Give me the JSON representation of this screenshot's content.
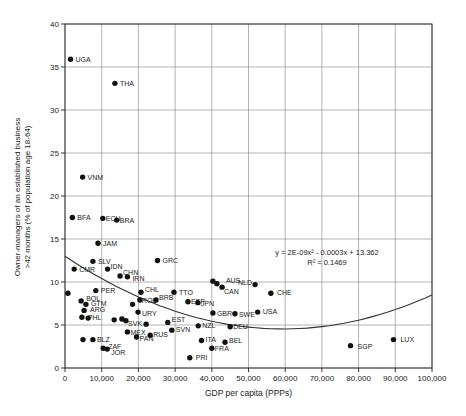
{
  "figure": {
    "x_axis_title": "GDP per capita (PPPs)",
    "y_axis_title_line1": "Owner-managers of an established business",
    "y_axis_title_line2": ">42 months (% of population age 18-64)",
    "equation_line1": "y = 2E-09x² - 0.0003x + 13.362",
    "equation_line2": "R² = 0.1469",
    "dot_color": "#111111",
    "grid_color": "#808080",
    "border_color": "#333333",
    "label_color": "#222222"
  },
  "chart_data": {
    "type": "scatter",
    "title": "",
    "xlabel": "GDP per capita (PPPs)",
    "ylabel": "Owner-managers of an established business >42 months (% of population age 18-64)",
    "xlim": [
      0,
      100000
    ],
    "ylim": [
      0,
      40
    ],
    "grid": true,
    "x_tick_values": [
      0,
      10000,
      20000,
      30000,
      40000,
      50000,
      60000,
      70000,
      80000,
      90000,
      100000
    ],
    "x_tick_labels": [
      "0",
      "10,000",
      "20,000",
      "30,000",
      "40,000",
      "50,000",
      "60,000",
      "70,000",
      "80,000",
      "90,000",
      "100,000"
    ],
    "y_tick_values": [
      0,
      5,
      10,
      15,
      20,
      25,
      30,
      35,
      40
    ],
    "y_tick_labels": [
      "0",
      "5",
      "10",
      "15",
      "20",
      "25",
      "30",
      "35",
      "40"
    ],
    "annotation": {
      "equation": "y = 2E-09x² - 0.0003x + 13.362",
      "r_squared": "R² = 0.1469"
    },
    "trendline": {
      "type": "quadratic",
      "a": 2.4e-09,
      "b": -0.000285,
      "c": 13.0
    },
    "points": [
      {
        "label": "UGA",
        "x": 1500,
        "y": 35.9
      },
      {
        "label": "THA",
        "x": 13600,
        "y": 33.1
      },
      {
        "label": "VNM",
        "x": 4800,
        "y": 22.2
      },
      {
        "label": "BFA",
        "x": 2000,
        "y": 17.5
      },
      {
        "label": "ECU",
        "x": 10300,
        "y": 17.4,
        "dx": 3
      },
      {
        "label": "BRA",
        "x": 14100,
        "y": 17.2,
        "dx": 3
      },
      {
        "label": "JAM",
        "x": 9000,
        "y": 14.5
      },
      {
        "label": "SLV",
        "x": 7600,
        "y": 12.4
      },
      {
        "label": "GRC",
        "x": 25200,
        "y": 12.5
      },
      {
        "label": "CMR",
        "x": 2500,
        "y": 11.5
      },
      {
        "label": "IDN",
        "x": 11600,
        "y": 11.5,
        "dx": 3,
        "dy": 0
      },
      {
        "label": "CHN",
        "x": 15000,
        "y": 10.7,
        "dx": 3,
        "dy": -1
      },
      {
        "label": "IRN",
        "x": 17000,
        "y": 10.6,
        "dx": 5,
        "dy": 4
      },
      {
        "label": "",
        "x": 800,
        "y": 8.7
      },
      {
        "label": "PER",
        "x": 8400,
        "y": 9.0
      },
      {
        "label": "CHL",
        "x": 20700,
        "y": 8.8,
        "dx": 4,
        "dy": 0
      },
      {
        "label": "TTO",
        "x": 29700,
        "y": 8.8
      },
      {
        "label": "ROU",
        "x": 20400,
        "y": 7.9,
        "dx": 2,
        "dy": 3
      },
      {
        "label": "BRB",
        "x": 24800,
        "y": 7.9,
        "dx": 3,
        "dy": 0
      },
      {
        "label": "ESP",
        "x": 33500,
        "y": 7.7,
        "dx": 3,
        "dy": 2
      },
      {
        "label": "JPN",
        "x": 36200,
        "y": 7.6,
        "dx": 3,
        "dy": 3
      },
      {
        "label": "",
        "x": 18400,
        "y": 7.4
      },
      {
        "label": "BOL",
        "x": 4400,
        "y": 7.8,
        "dx": 5,
        "dy": 0
      },
      {
        "label": "GTM",
        "x": 5700,
        "y": 7.4,
        "dx": 5,
        "dy": 2
      },
      {
        "label": "ARG",
        "x": 5200,
        "y": 6.7,
        "dx": 6,
        "dy": 2
      },
      {
        "label": "PHL",
        "x": 4600,
        "y": 5.9,
        "dx": 6,
        "dy": 3
      },
      {
        "label": "",
        "x": 6300,
        "y": 5.8
      },
      {
        "label": "URY",
        "x": 19900,
        "y": 6.5,
        "dx": 4,
        "dy": 4
      },
      {
        "label": "",
        "x": 13400,
        "y": 5.6
      },
      {
        "label": "",
        "x": 15500,
        "y": 5.7
      },
      {
        "label": "",
        "x": 16600,
        "y": 5.5
      },
      {
        "label": "GBR",
        "x": 40300,
        "y": 6.4,
        "dx": 4,
        "dy": 3
      },
      {
        "label": "SWE",
        "x": 46300,
        "y": 6.3,
        "dx": 4,
        "dy": 3
      },
      {
        "label": "USA",
        "x": 52500,
        "y": 6.5,
        "dx": 5,
        "dy": 2
      },
      {
        "label": "CHE",
        "x": 56100,
        "y": 8.7,
        "dx": 6,
        "dy": 2
      },
      {
        "label": "AUS",
        "x": 40300,
        "y": 10.1,
        "dx": 13,
        "dy": 2
      },
      {
        "label": "NLD",
        "x": 41400,
        "y": 9.8,
        "dx": 21,
        "dy": 1
      },
      {
        "label": "CAN",
        "x": 42800,
        "y": 9.4,
        "dx": 2,
        "dy": 7
      },
      {
        "label": "",
        "x": 51800,
        "y": 9.7
      },
      {
        "label": "DEU",
        "x": 45000,
        "y": 4.8,
        "dx": 3,
        "dy": 2
      },
      {
        "label": "EST",
        "x": 28000,
        "y": 5.3,
        "dx": 4,
        "dy": 0
      },
      {
        "label": "SVK",
        "x": 22100,
        "y": 5.1,
        "dx": -4,
        "dy": 2,
        "anchor": "end"
      },
      {
        "label": "SVN",
        "x": 29100,
        "y": 4.4,
        "dx": 4,
        "dy": 2
      },
      {
        "label": "NZL",
        "x": 36300,
        "y": 4.9,
        "dx": 4,
        "dy": 2
      },
      {
        "label": "ITA",
        "x": 37200,
        "y": 3.2,
        "dx": 4,
        "dy": 2
      },
      {
        "label": "BEL",
        "x": 43600,
        "y": 3.0,
        "dx": 4,
        "dy": 1
      },
      {
        "label": "FRA",
        "x": 40000,
        "y": 2.3,
        "dx": 3,
        "dy": 3
      },
      {
        "label": "MEX",
        "x": 17000,
        "y": 4.2,
        "dx": 3,
        "dy": 3
      },
      {
        "label": "PAN",
        "x": 19500,
        "y": 3.6,
        "dx": 3,
        "dy": 4
      },
      {
        "label": "RUS",
        "x": 23200,
        "y": 3.8,
        "dx": 3,
        "dy": 2
      },
      {
        "label": "BLZ",
        "x": 7600,
        "y": 3.3,
        "dx": 4,
        "dy": 2
      },
      {
        "label": "",
        "x": 4900,
        "y": 3.3
      },
      {
        "label": "ZAF",
        "x": 10400,
        "y": 2.3,
        "dx": 5,
        "dy": 1
      },
      {
        "label": "JOR",
        "x": 11500,
        "y": 2.2,
        "dx": 4,
        "dy": 6
      },
      {
        "label": "PRI",
        "x": 34000,
        "y": 1.2,
        "dx": 6,
        "dy": 2
      },
      {
        "label": "SGP",
        "x": 77800,
        "y": 2.6,
        "dx": 7,
        "dy": 3
      },
      {
        "label": "LUX",
        "x": 89500,
        "y": 3.3,
        "dx": 7,
        "dy": 2
      }
    ]
  }
}
